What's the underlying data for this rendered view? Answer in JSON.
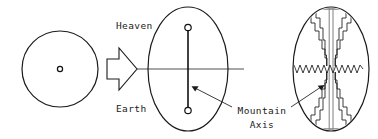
{
  "figure": {
    "background_color": "#ffffff",
    "line_color": "#1a1a1a",
    "pillar_color": "#8a8a8a",
    "width": 378,
    "height": 139
  },
  "labels": {
    "heaven": "Heaven",
    "earth": "Earth",
    "mountain_axis_line1": "Mountain",
    "mountain_axis_line2": "Axis"
  },
  "panels": [
    {
      "id": "panel-circle",
      "name": "undifferentiated-circle",
      "shape": "circle",
      "center_marker": "small-ring",
      "cx": 60,
      "cy": 69,
      "r": 38
    },
    {
      "id": "panel-axis-ellipse",
      "name": "heaven-earth-ellipse",
      "shape": "ellipse",
      "cx": 188,
      "cy": 69,
      "rx": 40,
      "ry": 62,
      "horizon_line": true,
      "axis_endpoints": 2
    },
    {
      "id": "panel-mountain-ellipse",
      "name": "stepped-mountain-ellipse",
      "shape": "ellipse",
      "cx": 331,
      "cy": 69,
      "rx": 38,
      "ry": 62,
      "terraced_mountain": true,
      "wavy_horizon": true
    }
  ],
  "transition": {
    "arrow_name": "block-arrow-right",
    "direction": "right"
  }
}
